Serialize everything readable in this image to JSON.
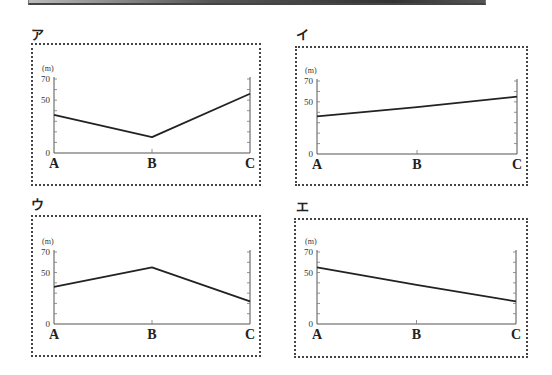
{
  "page": {
    "top_bar": true
  },
  "panels": [
    {
      "id": "a",
      "label": "ア"
    },
    {
      "id": "i",
      "label": "イ"
    },
    {
      "id": "u",
      "label": "ウ"
    },
    {
      "id": "e",
      "label": "エ"
    }
  ],
  "axis": {
    "unit": "(m)",
    "ticks": [
      "0",
      "50",
      "70"
    ],
    "categories": [
      "A",
      "B",
      "C"
    ]
  },
  "chart_data": [
    {
      "type": "line",
      "title": "ア",
      "categories": [
        "A",
        "B",
        "C"
      ],
      "values": [
        36,
        15,
        56
      ],
      "xlabel": "",
      "ylabel": "(m)",
      "ylim": [
        0,
        70
      ],
      "yticks": [
        0,
        50,
        70
      ],
      "grid": false,
      "legend": null
    },
    {
      "type": "line",
      "title": "イ",
      "categories": [
        "A",
        "B",
        "C"
      ],
      "values": [
        36,
        45,
        55
      ],
      "xlabel": "",
      "ylabel": "(m)",
      "ylim": [
        0,
        70
      ],
      "yticks": [
        0,
        50,
        70
      ],
      "grid": false,
      "legend": null
    },
    {
      "type": "line",
      "title": "ウ",
      "categories": [
        "A",
        "B",
        "C"
      ],
      "values": [
        36,
        55,
        22
      ],
      "xlabel": "",
      "ylabel": "(m)",
      "ylim": [
        0,
        70
      ],
      "yticks": [
        0,
        50,
        70
      ],
      "grid": false,
      "legend": null
    },
    {
      "type": "line",
      "title": "エ",
      "categories": [
        "A",
        "B",
        "C"
      ],
      "values": [
        55,
        38,
        22
      ],
      "xlabel": "",
      "ylabel": "(m)",
      "ylim": [
        0,
        70
      ],
      "yticks": [
        0,
        50,
        70
      ],
      "grid": false,
      "legend": null
    }
  ]
}
